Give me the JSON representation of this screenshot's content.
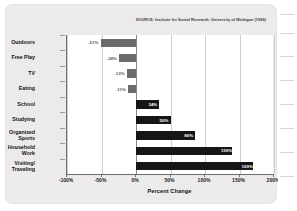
{
  "figure": {
    "source_note": "SOURCE: Institute for Social Research, University of Michigan (1999)"
  },
  "chart_data": {
    "type": "bar",
    "orientation": "horizontal",
    "title": "",
    "subtitle": "",
    "xlabel": "Percent Change",
    "ylabel": "",
    "xlim": [
      -100,
      200
    ],
    "xticks": [
      -100,
      -50,
      0,
      50,
      100,
      150,
      200
    ],
    "xtick_labels": [
      "-100%",
      "-50%",
      "0%",
      "50%",
      "100%",
      "150%",
      "200%"
    ],
    "grid": true,
    "legend": "none",
    "categories": [
      "Outdoors",
      "Free Play",
      "TV",
      "Eating",
      "School",
      "Studying",
      "Organized Sports",
      "Household Work",
      "Visiting/Traveling"
    ],
    "values": [
      -51,
      -24,
      -13,
      -11,
      34,
      50,
      86,
      139,
      169
    ],
    "data_labels": [
      "-51%",
      "-24%",
      "-13%",
      "-11%",
      "34%",
      "50%",
      "86%",
      "139%",
      "169%"
    ],
    "colors": {
      "negative_bar": "#6b6b6b",
      "positive_bar": "#161616",
      "plot_background": "#ffffff",
      "card_background": "#eceaea",
      "gridline": "#cfcfcf",
      "axis": "#6d6d6d"
    },
    "bars": [
      {
        "label": "Outdoors",
        "label_line2": "",
        "value": -51,
        "display": "-51%",
        "sign": "neg"
      },
      {
        "label": "Free Play",
        "label_line2": "",
        "value": -24,
        "display": "-24%",
        "sign": "neg"
      },
      {
        "label": "TV",
        "label_line2": "",
        "value": -13,
        "display": "-13%",
        "sign": "neg"
      },
      {
        "label": "Eating",
        "label_line2": "",
        "value": -11,
        "display": "-11%",
        "sign": "neg"
      },
      {
        "label": "School",
        "label_line2": "",
        "value": 34,
        "display": "34%",
        "sign": "pos"
      },
      {
        "label": "Studying",
        "label_line2": "",
        "value": 50,
        "display": "50%",
        "sign": "pos"
      },
      {
        "label": "Organized",
        "label_line2": "Sports",
        "value": 86,
        "display": "86%",
        "sign": "pos"
      },
      {
        "label": "Household",
        "label_line2": "Work",
        "value": 139,
        "display": "139%",
        "sign": "pos"
      },
      {
        "label": "Visiting/",
        "label_line2": "Traveling",
        "value": 169,
        "display": "169%",
        "sign": "pos"
      }
    ]
  }
}
